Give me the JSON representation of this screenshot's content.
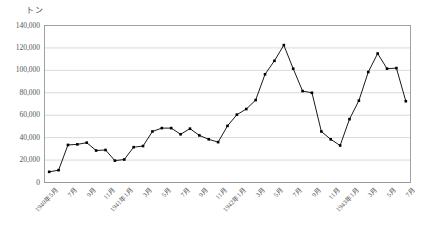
{
  "chart_data": {
    "type": "line",
    "title": "",
    "subtitle": "",
    "xlabel": "",
    "ylabel": "トン",
    "unit_label": "トン",
    "ylim": [
      0,
      140000
    ],
    "ytick_labels": [
      "140,000",
      "120,000",
      "100,000",
      "80,000",
      "60,000",
      "40,000",
      "20,000",
      "0"
    ],
    "ytick_values": [
      140000,
      120000,
      100000,
      80000,
      60000,
      40000,
      20000,
      0
    ],
    "grid": true,
    "legend": false,
    "marker": "filled-square",
    "line_color": "#000000",
    "grid_color": "#bfbfbf",
    "categories": [
      "1940年5月",
      "",
      "7月",
      "",
      "9月",
      "",
      "11月",
      "",
      "1941年1月",
      "",
      "3月",
      "",
      "5月",
      "",
      "7月",
      "",
      "9月",
      "",
      "11月",
      "",
      "1942年1月",
      "",
      "3月",
      "",
      "5月",
      "",
      "7月",
      "",
      "9月",
      "",
      "11月",
      "",
      "1943年1月",
      "",
      "3月",
      "",
      "5月",
      "",
      "7月"
    ],
    "xtick_labels": [
      "1940年5月",
      "7月",
      "9月",
      "11月",
      "1941年1月",
      "3月",
      "5月",
      "7月",
      "9月",
      "11月",
      "1942年1月",
      "3月",
      "5月",
      "7月",
      "9月",
      "11月",
      "1943年1月",
      "3月",
      "5月",
      "7月"
    ],
    "values": [
      9500,
      11000,
      33500,
      34000,
      35500,
      28500,
      29000,
      19500,
      20500,
      31500,
      32500,
      45500,
      48500,
      48500,
      43000,
      48000,
      42000,
      38500,
      36000,
      50500,
      60500,
      65500,
      73500,
      96500,
      108500,
      122500,
      101500,
      81500,
      80000,
      45500,
      38500,
      33000,
      56500,
      73000,
      98500,
      115000,
      101500,
      102000,
      72500
    ],
    "x_count": 39
  }
}
